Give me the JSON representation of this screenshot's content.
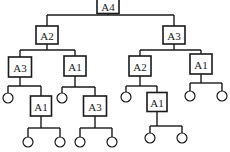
{
  "diagram": {
    "type": "tree",
    "nodes": [
      {
        "id": "n0",
        "label": "A4",
        "kind": "box",
        "x": 108,
        "y": 6,
        "w": 22,
        "h": 15
      },
      {
        "id": "n1",
        "label": "A2",
        "kind": "box",
        "x": 47,
        "y": 35,
        "w": 22,
        "h": 18
      },
      {
        "id": "n2",
        "label": "A3",
        "kind": "box",
        "x": 174,
        "y": 35,
        "w": 22,
        "h": 18
      },
      {
        "id": "n3",
        "label": "A3",
        "kind": "box",
        "x": 20,
        "y": 67,
        "w": 23,
        "h": 20
      },
      {
        "id": "n4",
        "label": "A1",
        "kind": "box",
        "x": 75,
        "y": 66,
        "w": 22,
        "h": 20
      },
      {
        "id": "n5",
        "label": "A2",
        "kind": "box",
        "x": 140,
        "y": 66,
        "w": 22,
        "h": 20
      },
      {
        "id": "n6",
        "label": "A1",
        "kind": "box",
        "x": 201,
        "y": 64,
        "w": 22,
        "h": 20
      },
      {
        "id": "n7",
        "label": "",
        "kind": "leaf",
        "x": 8,
        "y": 98
      },
      {
        "id": "n8",
        "label": "A1",
        "kind": "box",
        "x": 41,
        "y": 106,
        "w": 21,
        "h": 20
      },
      {
        "id": "n9",
        "label": "",
        "kind": "leaf",
        "x": 62,
        "y": 98
      },
      {
        "id": "n10",
        "label": "A3",
        "kind": "box",
        "x": 95,
        "y": 106,
        "w": 23,
        "h": 20
      },
      {
        "id": "n11",
        "label": "",
        "kind": "leaf",
        "x": 126,
        "y": 97
      },
      {
        "id": "n12",
        "label": "A1",
        "kind": "box",
        "x": 157,
        "y": 102,
        "w": 20,
        "h": 19
      },
      {
        "id": "n13",
        "label": "",
        "kind": "leaf",
        "x": 190,
        "y": 96
      },
      {
        "id": "n14",
        "label": "",
        "kind": "leaf",
        "x": 222,
        "y": 96
      },
      {
        "id": "n15",
        "label": "",
        "kind": "leaf",
        "x": 28,
        "y": 142
      },
      {
        "id": "n16",
        "label": "",
        "kind": "leaf",
        "x": 60,
        "y": 142
      },
      {
        "id": "n17",
        "label": "",
        "kind": "leaf",
        "x": 80,
        "y": 142
      },
      {
        "id": "n18",
        "label": "",
        "kind": "leaf",
        "x": 112,
        "y": 142
      },
      {
        "id": "n19",
        "label": "",
        "kind": "leaf",
        "x": 150,
        "y": 138
      },
      {
        "id": "n20",
        "label": "",
        "kind": "leaf",
        "x": 182,
        "y": 138
      }
    ],
    "edges": [
      {
        "parent": "n0",
        "children": [
          "n1",
          "n2"
        ],
        "bar_y": 15
      },
      {
        "parent": "n1",
        "children": [
          "n3",
          "n4"
        ],
        "bar_y": 50
      },
      {
        "parent": "n2",
        "children": [
          "n5",
          "n6"
        ],
        "bar_y": 50
      },
      {
        "parent": "n3",
        "children": [
          "n7",
          "n8"
        ],
        "bar_y": 86
      },
      {
        "parent": "n4",
        "children": [
          "n9",
          "n10"
        ],
        "bar_y": 87
      },
      {
        "parent": "n5",
        "children": [
          "n11",
          "n12"
        ],
        "bar_y": 86
      },
      {
        "parent": "n6",
        "children": [
          "n13",
          "n14"
        ],
        "bar_y": 83
      },
      {
        "parent": "n8",
        "children": [
          "n15",
          "n16"
        ],
        "bar_y": 128
      },
      {
        "parent": "n10",
        "children": [
          "n17",
          "n18"
        ],
        "bar_y": 128
      },
      {
        "parent": "n12",
        "children": [
          "n19",
          "n20"
        ],
        "bar_y": 126
      }
    ],
    "leaf_radius": 5
  }
}
